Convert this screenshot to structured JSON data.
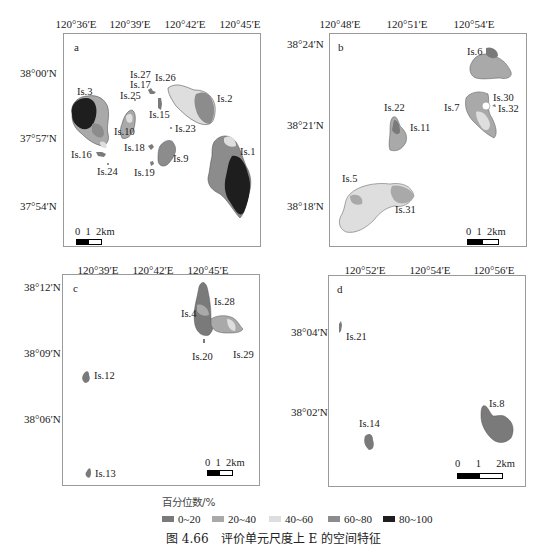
{
  "figure": {
    "caption": "图 4.66　评价单元尺度上 E 的空间特征"
  },
  "legend": {
    "title": "百分位数/%",
    "items": [
      {
        "label": "0~20",
        "color": "#7a7a7a"
      },
      {
        "label": "20~40",
        "color": "#a9a9a9"
      },
      {
        "label": "40~60",
        "color": "#dedede"
      },
      {
        "label": "60~80",
        "color": "#8c8c8c"
      },
      {
        "label": "80~100",
        "color": "#1e1e1e"
      }
    ]
  },
  "panels": {
    "a": {
      "label": "a",
      "x_ticks": [
        "120°36′E",
        "120°39′E",
        "120°42′E",
        "120°45′E"
      ],
      "y_ticks": [
        "38°00′N",
        "37°57′N",
        "37°54′N"
      ],
      "islands": [
        "Is.1",
        "Is.2",
        "Is.3",
        "Is.9",
        "Is.10",
        "Is.15",
        "Is.16",
        "Is.17",
        "Is.18",
        "Is.19",
        "Is.23",
        "Is.24",
        "Is.25",
        "Is.26",
        "Is.27"
      ],
      "scale": {
        "labels": [
          "0",
          "1",
          "2km"
        ]
      }
    },
    "b": {
      "label": "b",
      "x_ticks": [
        "120°48′E",
        "120°51′E",
        "120°54′E"
      ],
      "y_ticks": [
        "38°24′N",
        "38°21′N",
        "38°18′N"
      ],
      "islands": [
        "Is.5",
        "Is.6",
        "Is.7",
        "Is.11",
        "Is.22",
        "Is.30",
        "Is.31",
        "Is.32"
      ],
      "scale": {
        "labels": [
          "0",
          "1",
          "2km"
        ]
      }
    },
    "c": {
      "label": "c",
      "x_ticks": [
        "120°39′E",
        "120°42′E",
        "120°45′E"
      ],
      "y_ticks": [
        "38°12′N",
        "38°09′N",
        "38°06′N"
      ],
      "islands": [
        "Is.4",
        "Is.12",
        "Is.13",
        "Is.20",
        "Is.28",
        "Is.29"
      ],
      "scale": {
        "labels": [
          "0",
          "1",
          "2km"
        ]
      }
    },
    "d": {
      "label": "d",
      "x_ticks": [
        "120°52′E",
        "120°54′E",
        "120°56′E"
      ],
      "y_ticks": [
        "38°04′N",
        "38°02′N"
      ],
      "islands": [
        "Is.8",
        "Is.14",
        "Is.21"
      ],
      "scale": {
        "labels": [
          "0",
          "1",
          "2km"
        ]
      }
    }
  }
}
